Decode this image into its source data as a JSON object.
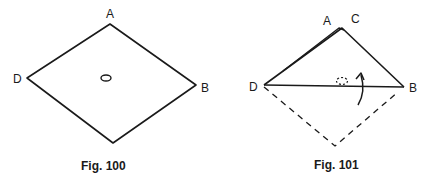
{
  "figures": [
    {
      "caption": "Fig. 100",
      "shape": "square-diamond",
      "labels": {
        "top": "A",
        "right": "B",
        "left": "D"
      },
      "features": [
        "center-hole-oval"
      ]
    },
    {
      "caption": "Fig. 101",
      "shape": "folded-triangle",
      "labels": {
        "apex_left": "A",
        "apex_right": "C",
        "left": "D",
        "right": "B"
      },
      "features": [
        "dashed-original-outline",
        "dashed-hole-oval",
        "fold-up-arrow"
      ]
    }
  ],
  "colors": {
    "ink": "#1a1a1a",
    "background": "#ffffff"
  }
}
